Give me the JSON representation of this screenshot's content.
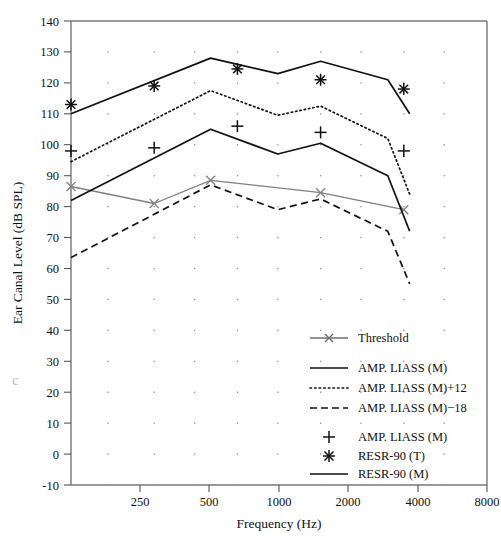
{
  "chart_data": {
    "type": "line",
    "title": "",
    "xlabel": "Frequency (Hz)",
    "ylabel": "Ear Canal Level (dB SPL)",
    "xscale": "log",
    "xlim": [
      250,
      8000
    ],
    "ylim": [
      -10,
      140
    ],
    "xticks": [
      250,
      500,
      1000,
      2000,
      4000,
      8000
    ],
    "xtick_labels": [
      "250",
      "500",
      "1000",
      "2000",
      "4000",
      "8000"
    ],
    "yticks": [
      -10,
      0,
      10,
      20,
      30,
      40,
      50,
      60,
      70,
      80,
      90,
      100,
      110,
      120,
      130,
      140
    ],
    "ytick_labels": [
      "-10",
      "0",
      "10",
      "20",
      "30",
      "40",
      "50",
      "60",
      "70",
      "80",
      "90",
      "100",
      "110",
      "120",
      "130",
      "140"
    ],
    "grid": "dotted-points",
    "legend_position": "lower-right-inside",
    "series": [
      {
        "name": "Threshold",
        "style": "solid-gray-with-x-markers",
        "marker": "x",
        "color": "#808080",
        "x": [
          250,
          500,
          800,
          2000,
          4000
        ],
        "y": [
          86.5,
          81.0,
          88.5,
          84.5,
          79.0
        ]
      },
      {
        "name": "AMP. LIASS (M)",
        "style": "solid",
        "marker": "none",
        "color": "#111111",
        "x": [
          250,
          800,
          1400,
          2000,
          3500,
          4200
        ],
        "y": [
          82.0,
          105.0,
          97.0,
          100.5,
          90.0,
          72.0
        ]
      },
      {
        "name": "AMP. LIASS (M)+12",
        "style": "dotted",
        "marker": "none",
        "color": "#111111",
        "x": [
          250,
          800,
          1400,
          2000,
          3500,
          4200
        ],
        "y": [
          94.5,
          117.5,
          109.5,
          112.5,
          102.0,
          84.0
        ]
      },
      {
        "name": "AMP. LIASS (M)-18",
        "style": "dashed",
        "marker": "none",
        "color": "#111111",
        "x": [
          250,
          800,
          1400,
          2000,
          3500,
          4200
        ],
        "y": [
          63.5,
          87.0,
          79.0,
          82.5,
          72.0,
          55.0
        ]
      },
      {
        "name": "RESR-90 (M)",
        "style": "solid",
        "marker": "none",
        "color": "#111111",
        "x": [
          250,
          800,
          1400,
          2000,
          3500,
          4200
        ],
        "y": [
          110.0,
          128.0,
          123.0,
          127.0,
          121.0,
          110.0
        ]
      },
      {
        "name": "AMP. LIASS (M) points",
        "style": "markers-only",
        "marker": "plus",
        "color": "#111111",
        "x": [
          250,
          500,
          1000,
          2000,
          4000
        ],
        "y": [
          98.0,
          99.0,
          106.0,
          104.0,
          98.0
        ]
      },
      {
        "name": "RESR-90 (T) points",
        "style": "markers-only",
        "marker": "asterisk",
        "color": "#111111",
        "x": [
          250,
          500,
          1000,
          2000,
          4000
        ],
        "y": [
          113.0,
          119.0,
          124.5,
          121.0,
          118.0
        ]
      }
    ]
  },
  "axes": {
    "y_title": "Ear Canal Level (dB SPL)",
    "x_title": "Frequency (Hz)"
  },
  "legend": {
    "entries": [
      {
        "label": "Threshold",
        "symbol": "line-x"
      },
      {
        "label": "AMP. LIASS (M)",
        "symbol": "solid-line"
      },
      {
        "label": "AMP. LIASS (M)+12",
        "symbol": "dotted-line"
      },
      {
        "label": "AMP. LIASS (M)−18",
        "symbol": "dashed-line"
      },
      {
        "label": "AMP. LIASS (M)",
        "symbol": "plus"
      },
      {
        "label": "RESR-90 (T)",
        "symbol": "asterisk"
      },
      {
        "label": "RESR-90 (M)",
        "symbol": "solid-line"
      }
    ]
  },
  "artifacts": {
    "margin_mark": "c"
  }
}
